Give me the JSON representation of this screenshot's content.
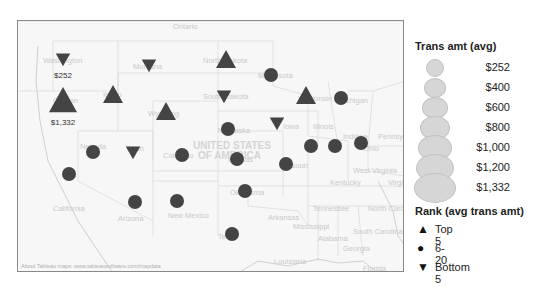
{
  "map": {
    "country_label": [
      "UNITED STATES",
      "OF AMERICA"
    ],
    "attribution": "About Tableau maps: www.tableausoftware.com/mapdata",
    "background_labels": [
      "Ontario",
      "Washington",
      "Oregon",
      "Idaho",
      "Montana",
      "Wyoming",
      "North Dakota",
      "South Dakota",
      "Minnesota",
      "Wisconsin",
      "Michigan",
      "Iowa",
      "Nebraska",
      "Nevada",
      "Utah",
      "Colorado",
      "Kansas",
      "Missouri",
      "Illinois",
      "Indiana",
      "Ohio",
      "California",
      "Arizona",
      "New Mexico",
      "Oklahoma",
      "Texas",
      "Arkansas",
      "Tennessee",
      "Kentucky",
      "West Virginia",
      "Virginia",
      "North Carolina",
      "South Carolina",
      "Georgia",
      "Alabama",
      "Mississippi",
      "Louisiana",
      "Florida",
      "Pennsylvania"
    ],
    "marker_color": "#444444",
    "markers": [
      {
        "state": "Washington",
        "rank": "Bottom 5",
        "label": "$252"
      },
      {
        "state": "Oregon",
        "rank": "Top 5",
        "label": "$1,332"
      },
      {
        "state": "Idaho",
        "rank": "Top 5"
      },
      {
        "state": "Montana",
        "rank": "Bottom 5"
      },
      {
        "state": "Wyoming",
        "rank": "Top 5"
      },
      {
        "state": "North Dakota",
        "rank": "Top 5"
      },
      {
        "state": "South Dakota",
        "rank": "Bottom 5"
      },
      {
        "state": "Minnesota",
        "rank": "6-20"
      },
      {
        "state": "Wisconsin",
        "rank": "Top 5"
      },
      {
        "state": "Michigan",
        "rank": "6-20"
      },
      {
        "state": "Iowa",
        "rank": "Bottom 5"
      },
      {
        "state": "Nebraska",
        "rank": "6-20"
      },
      {
        "state": "Nevada",
        "rank": "6-20"
      },
      {
        "state": "Utah",
        "rank": "Bottom 5"
      },
      {
        "state": "Colorado",
        "rank": "6-20"
      },
      {
        "state": "Kansas",
        "rank": "6-20"
      },
      {
        "state": "Missouri",
        "rank": "6-20"
      },
      {
        "state": "Illinois",
        "rank": "6-20"
      },
      {
        "state": "Indiana",
        "rank": "6-20"
      },
      {
        "state": "Ohio",
        "rank": "6-20"
      },
      {
        "state": "California",
        "rank": "6-20"
      },
      {
        "state": "Arizona",
        "rank": "6-20"
      },
      {
        "state": "New Mexico",
        "rank": "6-20"
      },
      {
        "state": "Oklahoma",
        "rank": "6-20"
      },
      {
        "state": "Texas",
        "rank": "6-20"
      }
    ]
  },
  "legend_size": {
    "title": "Trans amt (avg)",
    "items": [
      "$252",
      "$400",
      "$600",
      "$800",
      "$1,000",
      "$1,200",
      "$1,332"
    ]
  },
  "legend_rank": {
    "title": "Rank (avg trans amt)",
    "items": [
      {
        "glyph": "▲",
        "label": "Top 5"
      },
      {
        "glyph": "●",
        "label": "6-20"
      },
      {
        "glyph": "▼",
        "label": "Bottom 5"
      }
    ]
  }
}
